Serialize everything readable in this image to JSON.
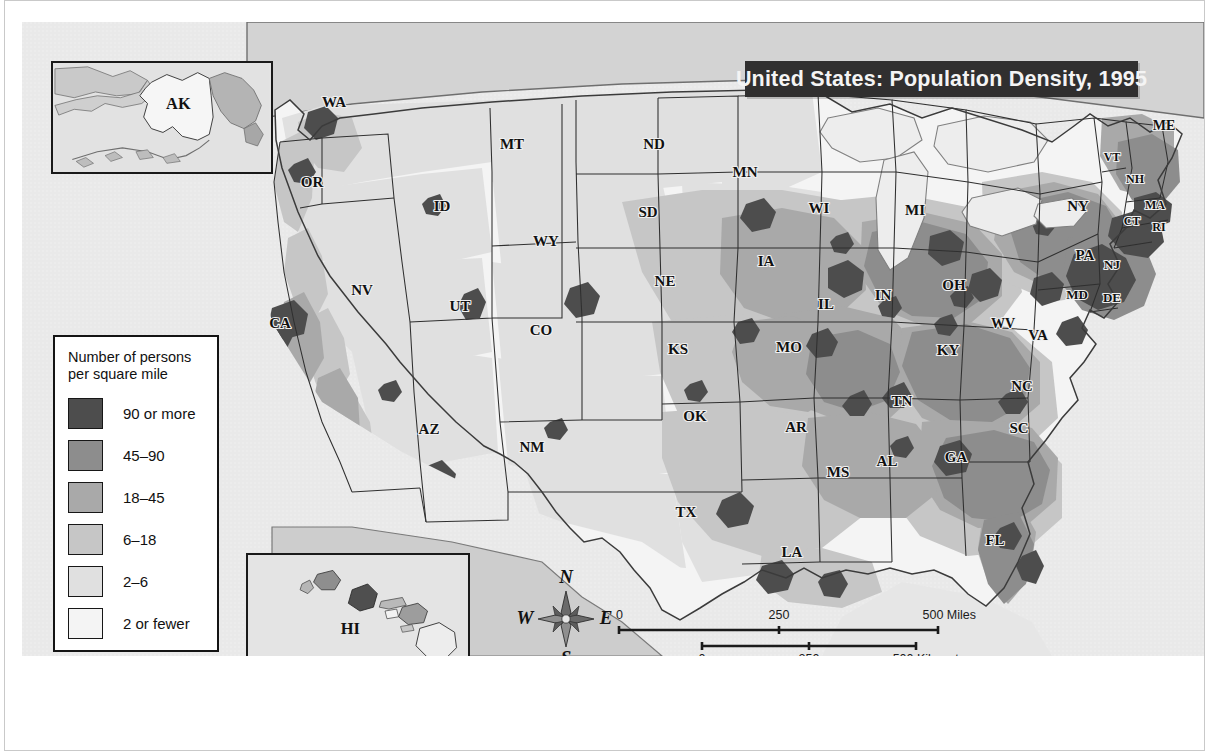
{
  "title": {
    "text": "United States: Population Density, 1995"
  },
  "legend": {
    "title": "Number of persons per square mile",
    "title_line1": "Number of persons",
    "title_line2": "per square mile",
    "entries": [
      {
        "label": "90 or more",
        "color": "#4d4d4d"
      },
      {
        "label": "45–90",
        "color": "#8d8d8d"
      },
      {
        "label": "18–45",
        "color": "#a9a9a9"
      },
      {
        "label": "6–18",
        "color": "#c6c6c6"
      },
      {
        "label": "2–6",
        "color": "#e0e0e0"
      },
      {
        "label": "2 or fewer",
        "color": "#f4f4f4"
      }
    ]
  },
  "compass": {
    "north": "N",
    "south": "S",
    "east": "E",
    "west": "W"
  },
  "scale_miles": {
    "ticks": [
      "0",
      "250",
      "500 Miles"
    ]
  },
  "scale_kilometers": {
    "ticks": [
      "0",
      "250",
      "500 Kilometers"
    ]
  },
  "insets": {
    "alaska": {
      "label": "AK"
    },
    "hawaii": {
      "label": "HI"
    }
  },
  "state_labels": [
    {
      "abbr": "WA",
      "x": 312,
      "y": 82,
      "size": 15
    },
    {
      "abbr": "OR",
      "x": 290,
      "y": 162,
      "size": 15
    },
    {
      "abbr": "CA",
      "x": 258,
      "y": 303,
      "size": 15
    },
    {
      "abbr": "NV",
      "x": 340,
      "y": 270,
      "size": 15
    },
    {
      "abbr": "ID",
      "x": 420,
      "y": 186,
      "size": 15
    },
    {
      "abbr": "MT",
      "x": 490,
      "y": 124,
      "size": 15
    },
    {
      "abbr": "WY",
      "x": 524,
      "y": 221,
      "size": 15
    },
    {
      "abbr": "UT",
      "x": 438,
      "y": 286,
      "size": 15
    },
    {
      "abbr": "AZ",
      "x": 407,
      "y": 409,
      "size": 15
    },
    {
      "abbr": "NM",
      "x": 510,
      "y": 427,
      "size": 15
    },
    {
      "abbr": "CO",
      "x": 519,
      "y": 310,
      "size": 15
    },
    {
      "abbr": "ND",
      "x": 632,
      "y": 124,
      "size": 15
    },
    {
      "abbr": "SD",
      "x": 626,
      "y": 192,
      "size": 15
    },
    {
      "abbr": "NE",
      "x": 643,
      "y": 261,
      "size": 15
    },
    {
      "abbr": "KS",
      "x": 656,
      "y": 329,
      "size": 15
    },
    {
      "abbr": "OK",
      "x": 673,
      "y": 396,
      "size": 15
    },
    {
      "abbr": "TX",
      "x": 664,
      "y": 492,
      "size": 15
    },
    {
      "abbr": "MN",
      "x": 723,
      "y": 152,
      "size": 15
    },
    {
      "abbr": "IA",
      "x": 744,
      "y": 241,
      "size": 15
    },
    {
      "abbr": "MO",
      "x": 767,
      "y": 327,
      "size": 15
    },
    {
      "abbr": "AR",
      "x": 774,
      "y": 407,
      "size": 15
    },
    {
      "abbr": "LA",
      "x": 770,
      "y": 532,
      "size": 15
    },
    {
      "abbr": "WI",
      "x": 797,
      "y": 188,
      "size": 15
    },
    {
      "abbr": "IL",
      "x": 804,
      "y": 284,
      "size": 15
    },
    {
      "abbr": "MS",
      "x": 816,
      "y": 452,
      "size": 15
    },
    {
      "abbr": "MI",
      "x": 893,
      "y": 190,
      "size": 15
    },
    {
      "abbr": "IN",
      "x": 861,
      "y": 275,
      "size": 15
    },
    {
      "abbr": "TN",
      "x": 880,
      "y": 381,
      "size": 15
    },
    {
      "abbr": "AL",
      "x": 865,
      "y": 441,
      "size": 15
    },
    {
      "abbr": "OH",
      "x": 932,
      "y": 265,
      "size": 15
    },
    {
      "abbr": "KY",
      "x": 926,
      "y": 330,
      "size": 15
    },
    {
      "abbr": "GA",
      "x": 934,
      "y": 437,
      "size": 15
    },
    {
      "abbr": "FL",
      "x": 973,
      "y": 520,
      "size": 15
    },
    {
      "abbr": "WV",
      "x": 981,
      "y": 303,
      "size": 14
    },
    {
      "abbr": "VA",
      "x": 1016,
      "y": 315,
      "size": 15
    },
    {
      "abbr": "NC",
      "x": 1000,
      "y": 366,
      "size": 15
    },
    {
      "abbr": "SC",
      "x": 997,
      "y": 408,
      "size": 15
    },
    {
      "abbr": "PA",
      "x": 1063,
      "y": 235,
      "size": 15
    },
    {
      "abbr": "NY",
      "x": 1056,
      "y": 186,
      "size": 15
    },
    {
      "abbr": "MD",
      "x": 1055,
      "y": 274,
      "size": 13
    },
    {
      "abbr": "DE",
      "x": 1090,
      "y": 277,
      "size": 13
    },
    {
      "abbr": "NJ",
      "x": 1090,
      "y": 244,
      "size": 13
    },
    {
      "abbr": "CT",
      "x": 1110,
      "y": 200,
      "size": 12
    },
    {
      "abbr": "RI",
      "x": 1137,
      "y": 206,
      "size": 12
    },
    {
      "abbr": "MA",
      "x": 1133,
      "y": 184,
      "size": 12
    },
    {
      "abbr": "NH",
      "x": 1113,
      "y": 158,
      "size": 12
    },
    {
      "abbr": "VT",
      "x": 1090,
      "y": 136,
      "size": 12
    },
    {
      "abbr": "ME",
      "x": 1142,
      "y": 105,
      "size": 14
    }
  ]
}
